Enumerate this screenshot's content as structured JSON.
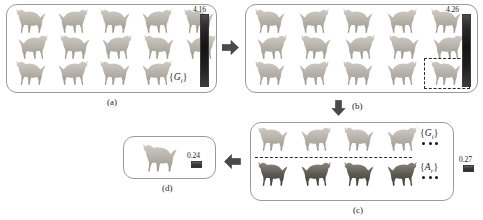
{
  "figure": {
    "panels": [
      {
        "id": "a",
        "caption": "(a)",
        "set_label": "{Gᵢ}",
        "set_label_text": "{G",
        "set_label_sub": "i",
        "value": "4.16",
        "horse_count": 14,
        "rows": [
          5,
          5,
          4
        ],
        "colorbar": "dark-vertical-gradient"
      },
      {
        "id": "b",
        "caption": "(b)",
        "value": "4.26",
        "horse_count": 15,
        "rows": [
          5,
          5,
          5
        ],
        "selection": "dashed-rectangle-last-horse",
        "colorbar": "dark-vertical-gradient"
      },
      {
        "id": "c",
        "caption": "(c)",
        "set_label_top_text": "{G",
        "set_label_top_sub": "i",
        "set_label_top": "{Gᵢ}",
        "set_label_bottom_text": "{A",
        "set_label_bottom_sub": "r",
        "set_label_bottom": "{Aᵣ}",
        "value": "0.27",
        "top_row_horses": 4,
        "bottom_row_horses": 4,
        "divider": "dashed-horizontal-line",
        "colorbar": "dark-small-swatch"
      },
      {
        "id": "d",
        "caption": "(d)",
        "value": "0.24",
        "horse_count": 1,
        "colorbar": "dark-small-swatch"
      }
    ],
    "arrows": [
      {
        "name": "arrow-a-to-b",
        "direction": "right"
      },
      {
        "name": "arrow-b-to-c",
        "direction": "down"
      },
      {
        "name": "arrow-c-to-d",
        "direction": "left"
      }
    ],
    "colors": {
      "panel_border": "#9a9a9a",
      "arrow": "#4a4a4a",
      "dashed": "#2b2b2b",
      "text": "#1c1c1c",
      "horse_light": "#b9b5ae",
      "horse_dark": "#595650"
    }
  }
}
